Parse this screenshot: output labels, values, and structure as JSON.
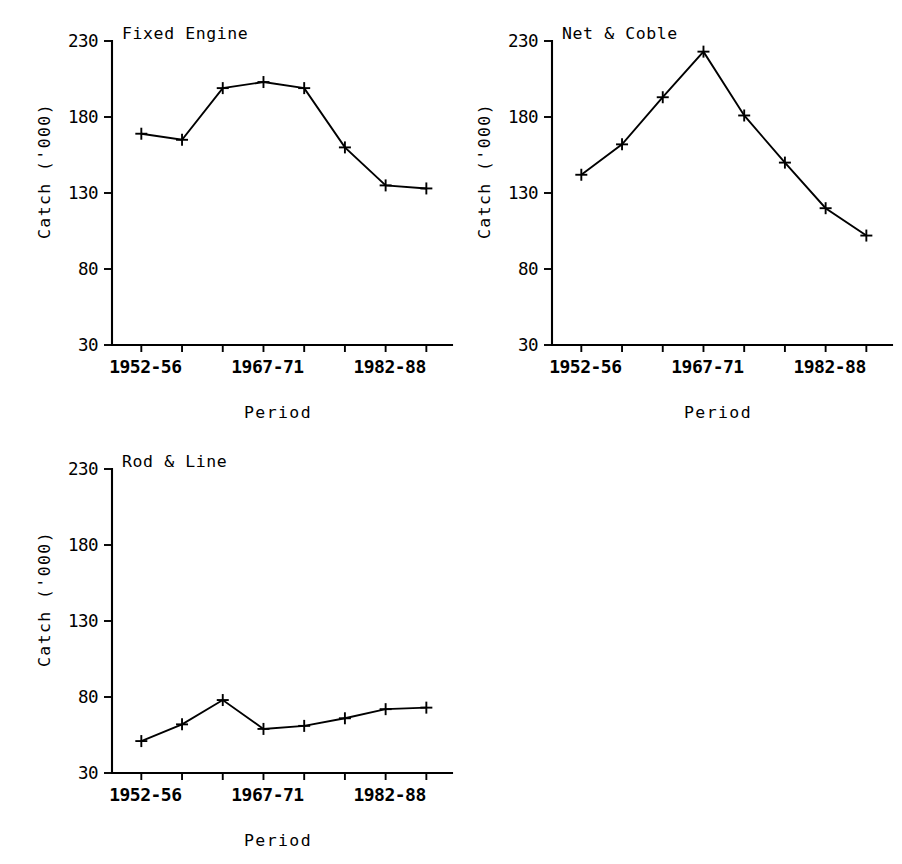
{
  "figure": {
    "background": "#ffffff",
    "ink_color": "#000000",
    "panel_count": 3
  },
  "chart_data": [
    {
      "type": "line",
      "title": "Fixed Engine",
      "xlabel": "Period",
      "ylabel": "Catch ('000)",
      "categories": [
        "1952-56",
        "1957-61",
        "1962-66",
        "1967-71",
        "1972-76",
        "1977-81",
        "1982-86",
        "1982-88"
      ],
      "x_tick_labels": [
        "1952-56",
        "1967-71",
        "1982-88"
      ],
      "x_tick_label_positions": [
        0,
        3,
        6
      ],
      "x_tick_count": 8,
      "values": [
        169,
        165,
        199,
        203,
        199,
        160,
        135,
        133
      ],
      "ylim": [
        30,
        230
      ],
      "yticks": [
        30,
        80,
        130,
        180,
        230
      ],
      "grid": false,
      "marker": "plus",
      "legend": "none"
    },
    {
      "type": "line",
      "title": "Net & Coble",
      "xlabel": "Period",
      "ylabel": "Catch ('000)",
      "categories": [
        "1952-56",
        "1957-61",
        "1962-66",
        "1967-71",
        "1972-76",
        "1977-81",
        "1982-86",
        "1982-88"
      ],
      "x_tick_labels": [
        "1952-56",
        "1967-71",
        "1982-88"
      ],
      "x_tick_label_positions": [
        0,
        3,
        6
      ],
      "x_tick_count": 8,
      "values": [
        142,
        162,
        193,
        223,
        181,
        150,
        120,
        102
      ],
      "ylim": [
        30,
        230
      ],
      "yticks": [
        30,
        80,
        130,
        180,
        230
      ],
      "grid": false,
      "marker": "plus",
      "legend": "none"
    },
    {
      "type": "line",
      "title": "Rod & Line",
      "xlabel": "Period",
      "ylabel": "Catch ('000)",
      "categories": [
        "1952-56",
        "1957-61",
        "1962-66",
        "1967-71",
        "1972-76",
        "1977-81",
        "1982-86",
        "1982-88"
      ],
      "x_tick_labels": [
        "1952-56",
        "1967-71",
        "1982-88"
      ],
      "x_tick_label_positions": [
        0,
        3,
        6
      ],
      "x_tick_count": 8,
      "values": [
        51,
        62,
        78,
        59,
        61,
        66,
        72,
        73
      ],
      "ylim": [
        30,
        230
      ],
      "yticks": [
        30,
        80,
        130,
        180,
        230
      ],
      "grid": false,
      "marker": "plus",
      "legend": "none"
    }
  ]
}
